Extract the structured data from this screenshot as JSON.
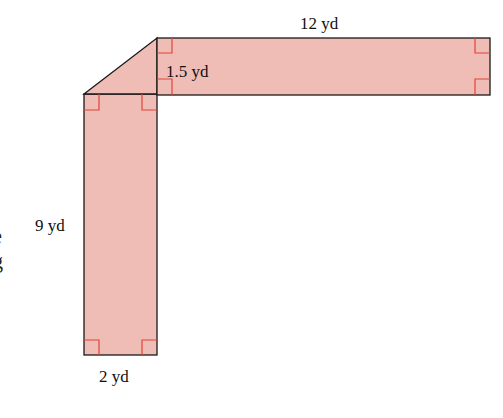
{
  "figure": {
    "colors": {
      "fill": "#EFBDB5",
      "outline": "#1a1a1a",
      "right_angle_marker": "#e0443a"
    },
    "labels": {
      "top_length": "12 yd",
      "top_width": "1.5 yd",
      "left_length": "9 yd",
      "bottom_width": "2 yd"
    },
    "clipped_text": {
      "line1": "e",
      "line2": "g"
    }
  }
}
